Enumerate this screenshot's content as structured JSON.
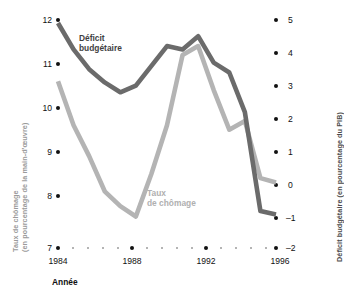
{
  "chart_data": {
    "type": "line",
    "title": "",
    "xlabel": "Année",
    "x": [
      1984,
      1985,
      1986,
      1987,
      1988,
      1989,
      1990,
      1991,
      1992,
      1993,
      1994,
      1995,
      1996,
      1997,
      1998
    ],
    "axes": {
      "left": {
        "label": "Taux de chômage (en pourcentage de la main-d'œuvre)",
        "ticks": [
          12,
          11,
          10,
          9,
          8,
          7
        ],
        "ylim": [
          7,
          12
        ]
      },
      "right": {
        "label": "Déficit budgétaire (en pourcentage du PIB)",
        "ticks": [
          5,
          4,
          3,
          2,
          1,
          0,
          -1,
          -2
        ],
        "ylim": [
          -2,
          5
        ]
      }
    },
    "xticks_major": [
      1984,
      1988,
      1992,
      1996
    ],
    "grid": false,
    "legend": "inline-annotations",
    "series": [
      {
        "name": "Déficit budgétaire",
        "axis": "right",
        "color": "#6b6b6b",
        "values": [
          4.9,
          4.1,
          3.5,
          3.1,
          2.8,
          3.0,
          3.6,
          4.2,
          4.1,
          4.5,
          3.7,
          3.4,
          2.2,
          -0.8,
          -0.9
        ]
      },
      {
        "name": "Taux de chômage",
        "axis": "left",
        "color": "#b4b4b4",
        "values": [
          10.6,
          9.6,
          8.9,
          8.1,
          7.8,
          7.6,
          8.5,
          9.6,
          11.2,
          11.4,
          10.4,
          9.5,
          9.7,
          8.4,
          8.3
        ]
      }
    ],
    "annotations": [
      {
        "text": "Déficit\nbudgétaire",
        "series": "Déficit budgétaire"
      },
      {
        "text": "Taux\nde chômage",
        "series": "Taux de chômage"
      }
    ]
  },
  "axis_left": {
    "title_line1": "Taux de chômage",
    "title_line2": "(en pourcentage de la main-d'œuvre)",
    "t12": "12",
    "t11": "11",
    "t10": "10",
    "t9": "9",
    "t8": "8",
    "t7": "7"
  },
  "axis_right": {
    "title": "Déficit budgétaire (en pourcentage du PIB)",
    "t5": "5",
    "t4": "4",
    "t3": "3",
    "t2": "2",
    "t1": "1",
    "t0": "0",
    "tm1": "–1",
    "tm2": "–2"
  },
  "axis_x": {
    "title": "Année",
    "t1984": "1984",
    "t1988": "1988",
    "t1992": "1992",
    "t1996": "1996"
  },
  "labels": {
    "deficit": "Déficit\nbudgétaire",
    "chomage": "Taux\nde chômage"
  },
  "colors": {
    "deficit_line": "#6b6b6b",
    "chomage_line": "#b4b4b4",
    "tick": "#111111",
    "minor_tick": "#9b9b9b",
    "left_title": "#9a9a9a",
    "right_title": "#4a4a4a"
  }
}
